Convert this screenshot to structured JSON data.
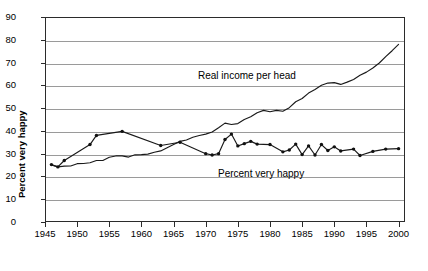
{
  "chart_data": {
    "type": "line",
    "title": "",
    "xlabel": "",
    "ylabel": "Percent very happy",
    "xlim": [
      1945,
      2001
    ],
    "ylim": [
      0,
      90
    ],
    "grid": true,
    "legend_position": "inline-annotations",
    "x_ticks": [
      "1945",
      "1950",
      "1955",
      "1960",
      "1965",
      "1970",
      "1975",
      "1980",
      "1985",
      "1990",
      "1995",
      "2000"
    ],
    "x_tick_values": [
      1945,
      1950,
      1955,
      1960,
      1965,
      1970,
      1975,
      1980,
      1985,
      1990,
      1995,
      2000
    ],
    "y_ticks": [
      "0",
      "10",
      "20",
      "30",
      "40",
      "50",
      "60",
      "70",
      "80",
      "90"
    ],
    "y_tick_values": [
      0,
      10,
      20,
      30,
      40,
      50,
      60,
      70,
      80,
      90
    ],
    "series": [
      {
        "name": "Real income per head",
        "annotation": "Real income per head",
        "markers": false,
        "x": [
          1946,
          1947,
          1948,
          1949,
          1950,
          1951,
          1952,
          1953,
          1954,
          1955,
          1956,
          1957,
          1958,
          1959,
          1960,
          1961,
          1962,
          1963,
          1964,
          1965,
          1966,
          1967,
          1968,
          1969,
          1970,
          1971,
          1972,
          1973,
          1974,
          1975,
          1976,
          1977,
          1978,
          1979,
          1980,
          1981,
          1982,
          1983,
          1984,
          1985,
          1986,
          1987,
          1988,
          1989,
          1990,
          1991,
          1992,
          1993,
          1994,
          1995,
          1996,
          1997,
          1998,
          1999,
          2000
        ],
        "y": [
          25.0,
          24.2,
          24.5,
          24.6,
          25.6,
          25.7,
          26.0,
          27.0,
          27.0,
          28.4,
          29.0,
          29.0,
          28.5,
          29.5,
          29.6,
          29.8,
          30.6,
          31.2,
          32.6,
          34.0,
          35.4,
          36.0,
          37.2,
          38.0,
          38.6,
          39.5,
          41.4,
          43.4,
          42.8,
          43.2,
          45.0,
          46.2,
          48.0,
          49.0,
          48.4,
          49.0,
          48.6,
          50.2,
          52.8,
          54.2,
          56.6,
          58.2,
          60.0,
          61.0,
          61.2,
          60.4,
          61.4,
          62.6,
          64.4,
          65.8,
          67.6,
          69.8,
          72.6,
          75.2,
          78.0
        ]
      },
      {
        "name": "Percent very happy",
        "annotation": "Percent very happy",
        "markers": true,
        "x": [
          1946,
          1947,
          1948,
          1952,
          1953,
          1957,
          1963,
          1966,
          1970,
          1971,
          1972,
          1973,
          1974,
          1975,
          1976,
          1977,
          1978,
          1980,
          1982,
          1983,
          1984,
          1985,
          1986,
          1987,
          1988,
          1989,
          1990,
          1991,
          1993,
          1994,
          1996,
          1998,
          2000
        ],
        "y": [
          25.2,
          24.2,
          27.0,
          34.0,
          38.0,
          39.8,
          33.6,
          35.0,
          30.0,
          29.4,
          30.0,
          36.2,
          38.6,
          33.4,
          34.4,
          35.4,
          34.2,
          34.0,
          30.8,
          31.6,
          34.2,
          29.6,
          33.4,
          29.4,
          34.0,
          31.4,
          33.0,
          31.2,
          32.0,
          29.2,
          31.0,
          32.0,
          32.2
        ]
      }
    ]
  }
}
